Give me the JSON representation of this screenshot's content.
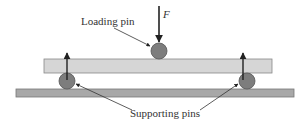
{
  "diagram": {
    "labels": {
      "loading_pin": "Loading pin",
      "force": "F",
      "supporting_pins": "Supporting pins"
    },
    "colors": {
      "beam": "#d4d4d4",
      "base": "#a8a8a8",
      "pin": "#7a7a7a",
      "arrow": "#222222"
    }
  }
}
